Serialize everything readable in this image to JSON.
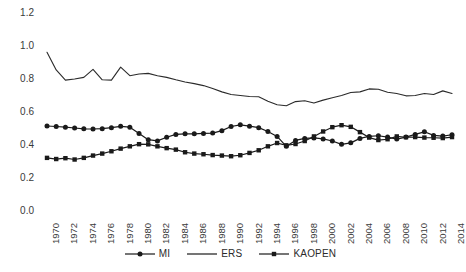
{
  "chart_data": {
    "type": "line",
    "title": "",
    "xlabel": "",
    "ylabel": "",
    "ylim": [
      0.0,
      1.2
    ],
    "xlim": [
      1970,
      2014
    ],
    "grid": false,
    "legend_position": "bottom",
    "ytick_labels": [
      "1.2",
      "1.0",
      "0.8",
      "0.6",
      "0.4",
      "0.2",
      "0.0"
    ],
    "ytick_values": [
      1.2,
      1.0,
      0.8,
      0.6,
      0.4,
      0.2,
      0.0
    ],
    "x": [
      1970,
      1971,
      1972,
      1973,
      1974,
      1975,
      1976,
      1977,
      1978,
      1979,
      1980,
      1981,
      1982,
      1983,
      1984,
      1985,
      1986,
      1987,
      1988,
      1989,
      1990,
      1991,
      1992,
      1993,
      1994,
      1995,
      1996,
      1997,
      1998,
      1999,
      2000,
      2001,
      2002,
      2003,
      2004,
      2005,
      2006,
      2007,
      2008,
      2009,
      2010,
      2011,
      2012,
      2013,
      2014
    ],
    "xtick_labels": [
      "1970",
      "1972",
      "1974",
      "1976",
      "1978",
      "1980",
      "1982",
      "1984",
      "1986",
      "1988",
      "1990",
      "1992",
      "1994",
      "1996",
      "1998",
      "2000",
      "2002",
      "2004",
      "2006",
      "2008",
      "2010",
      "2012",
      "2014"
    ],
    "xtick_values": [
      1970,
      1972,
      1974,
      1976,
      1978,
      1980,
      1982,
      1984,
      1986,
      1988,
      1990,
      1992,
      1994,
      1996,
      1998,
      2000,
      2002,
      2004,
      2006,
      2008,
      2010,
      2012,
      2014
    ],
    "series": [
      {
        "name": "MI",
        "marker": "circle",
        "color": "#1a1a1a",
        "values": [
          0.515,
          0.512,
          0.508,
          0.503,
          0.498,
          0.497,
          0.499,
          0.505,
          0.513,
          0.508,
          0.47,
          0.432,
          0.425,
          0.447,
          0.464,
          0.468,
          0.468,
          0.47,
          0.472,
          0.487,
          0.512,
          0.522,
          0.514,
          0.505,
          0.482,
          0.452,
          0.392,
          0.428,
          0.44,
          0.443,
          0.437,
          0.424,
          0.404,
          0.413,
          0.44,
          0.452,
          0.456,
          0.448,
          0.436,
          0.448,
          0.464,
          0.48,
          0.458,
          0.454,
          0.462
        ]
      },
      {
        "name": "ERS",
        "marker": "none",
        "color": "#2b2b2b",
        "values": [
          0.962,
          0.855,
          0.793,
          0.8,
          0.81,
          0.858,
          0.795,
          0.793,
          0.872,
          0.82,
          0.83,
          0.834,
          0.82,
          0.81,
          0.795,
          0.782,
          0.772,
          0.76,
          0.742,
          0.722,
          0.706,
          0.7,
          0.694,
          0.692,
          0.665,
          0.644,
          0.638,
          0.663,
          0.668,
          0.654,
          0.672,
          0.686,
          0.7,
          0.718,
          0.722,
          0.74,
          0.738,
          0.72,
          0.712,
          0.698,
          0.7,
          0.712,
          0.706,
          0.728,
          0.712
        ]
      },
      {
        "name": "KAOPEN",
        "marker": "square",
        "color": "#1a1a1a",
        "values": [
          0.322,
          0.315,
          0.32,
          0.312,
          0.322,
          0.336,
          0.348,
          0.362,
          0.378,
          0.392,
          0.405,
          0.404,
          0.392,
          0.381,
          0.372,
          0.356,
          0.348,
          0.344,
          0.339,
          0.336,
          0.332,
          0.338,
          0.352,
          0.368,
          0.392,
          0.412,
          0.398,
          0.406,
          0.424,
          0.452,
          0.482,
          0.508,
          0.52,
          0.51,
          0.478,
          0.445,
          0.43,
          0.435,
          0.452,
          0.447,
          0.448,
          0.445,
          0.444,
          0.442,
          0.448
        ]
      }
    ]
  },
  "legend": {
    "items": [
      {
        "label": "MI",
        "marker": "circle"
      },
      {
        "label": "ERS",
        "marker": "none"
      },
      {
        "label": "KAOPEN",
        "marker": "square"
      }
    ]
  }
}
